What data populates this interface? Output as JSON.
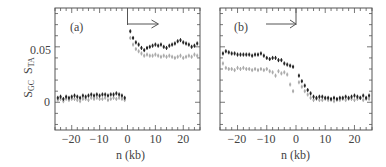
{
  "chart_data": [
    {
      "type": "scatter",
      "panel_label": "(a)",
      "title": "",
      "xlabel": "n (kb)",
      "ylabel": "S_GC  S_TA",
      "xlim": [
        -26,
        26
      ],
      "ylim": [
        -0.025,
        0.085
      ],
      "xticks": [
        -20,
        -10,
        0,
        10,
        20
      ],
      "yticks": [
        0,
        0.05
      ],
      "ytick_labels": [
        "0",
        "0.05"
      ],
      "grid": false,
      "annotation": "arrow pointing right from n=0",
      "series": [
        {
          "name": "S_GC",
          "color": "#222222",
          "x": [
            -25,
            -24,
            -23,
            -22,
            -21,
            -20,
            -19,
            -18,
            -17,
            -16,
            -15,
            -14,
            -13,
            -12,
            -11,
            -10,
            -9,
            -8,
            -7,
            -6,
            -5,
            -4,
            -3,
            -2,
            -1,
            1,
            2,
            3,
            4,
            5,
            6,
            7,
            8,
            9,
            10,
            11,
            12,
            13,
            14,
            15,
            16,
            17,
            18,
            19,
            20,
            21,
            22,
            23,
            24,
            25
          ],
          "y": [
            0.004,
            0.005,
            0.003,
            0.005,
            0.004,
            0.005,
            0.006,
            0.005,
            0.004,
            0.006,
            0.005,
            0.006,
            0.007,
            0.006,
            0.007,
            0.006,
            0.007,
            0.007,
            0.006,
            0.007,
            0.007,
            0.008,
            0.007,
            0.006,
            0.004,
            0.064,
            0.058,
            0.054,
            0.052,
            0.049,
            0.047,
            0.049,
            0.05,
            0.051,
            0.052,
            0.051,
            0.052,
            0.05,
            0.049,
            0.051,
            0.052,
            0.053,
            0.055,
            0.056,
            0.054,
            0.053,
            0.052,
            0.05,
            0.051,
            0.053
          ]
        },
        {
          "name": "S_TA",
          "color": "#aaaaaa",
          "x": [
            -25,
            -24,
            -23,
            -22,
            -21,
            -20,
            -19,
            -18,
            -17,
            -16,
            -15,
            -14,
            -13,
            -12,
            -11,
            -10,
            -9,
            -8,
            -7,
            -6,
            -5,
            -4,
            -3,
            -2,
            -1,
            1,
            2,
            3,
            4,
            5,
            6,
            7,
            8,
            9,
            10,
            11,
            12,
            13,
            14,
            15,
            16,
            17,
            18,
            19,
            20,
            21,
            22,
            23,
            24,
            25
          ],
          "y": [
            0.002,
            0.003,
            0.001,
            0.003,
            0.002,
            0.003,
            0.003,
            0.002,
            0.001,
            0.003,
            0.003,
            0.002,
            0.004,
            0.003,
            0.004,
            0.003,
            0.003,
            0.004,
            0.002,
            0.003,
            0.004,
            0.003,
            0.004,
            0.003,
            0.002,
            0.058,
            0.052,
            0.048,
            0.046,
            0.044,
            0.042,
            0.043,
            0.042,
            0.042,
            0.043,
            0.042,
            0.041,
            0.042,
            0.041,
            0.042,
            0.041,
            0.04,
            0.041,
            0.042,
            0.04,
            0.041,
            0.042,
            0.041,
            0.043,
            0.042
          ]
        }
      ]
    },
    {
      "type": "scatter",
      "panel_label": "(b)",
      "title": "",
      "xlabel": "n (kb)",
      "ylabel": "",
      "xlim": [
        -26,
        26
      ],
      "ylim": [
        -0.025,
        0.085
      ],
      "xticks": [
        -20,
        -10,
        0,
        10,
        20
      ],
      "yticks": [
        0,
        0.05
      ],
      "grid": false,
      "annotation": "arrow pointing right ending at n=0",
      "series": [
        {
          "name": "S_GC",
          "color": "#222222",
          "x": [
            -25,
            -24,
            -23,
            -22,
            -21,
            -20,
            -19,
            -18,
            -17,
            -16,
            -15,
            -14,
            -13,
            -12,
            -11,
            -10,
            -9,
            -8,
            -7,
            -6,
            -5,
            -4,
            -3,
            -2,
            -1,
            1,
            2,
            3,
            4,
            5,
            6,
            7,
            8,
            9,
            10,
            11,
            12,
            13,
            14,
            15,
            16,
            17,
            18,
            19,
            20,
            21,
            22,
            23,
            24,
            25
          ],
          "y": [
            0.044,
            0.046,
            0.045,
            0.044,
            0.044,
            0.043,
            0.043,
            0.043,
            0.043,
            0.043,
            0.042,
            0.043,
            0.043,
            0.044,
            0.042,
            0.04,
            0.039,
            0.04,
            0.04,
            0.038,
            0.038,
            0.035,
            0.034,
            0.033,
            0.032,
            0.024,
            0.019,
            0.015,
            0.011,
            0.008,
            0.005,
            0.004,
            0.005,
            0.005,
            0.004,
            0.004,
            0.003,
            0.004,
            0.003,
            0.004,
            0.004,
            0.005,
            0.004,
            0.005,
            0.006,
            0.005,
            0.004,
            0.006,
            0.004,
            0.006
          ]
        },
        {
          "name": "S_TA",
          "color": "#aaaaaa",
          "x": [
            -25,
            -24,
            -23,
            -22,
            -21,
            -20,
            -19,
            -18,
            -17,
            -16,
            -15,
            -14,
            -13,
            -12,
            -11,
            -10,
            -9,
            -8,
            -7,
            -6,
            -5,
            -4,
            -3,
            -2,
            -1,
            1,
            2,
            3,
            4,
            5,
            6,
            7,
            8,
            9,
            10,
            11,
            12,
            13,
            14,
            15,
            16,
            17,
            18,
            19,
            20,
            21,
            22,
            23,
            24,
            25
          ],
          "y": [
            0.035,
            0.031,
            0.03,
            0.03,
            0.029,
            0.031,
            0.03,
            0.031,
            0.03,
            0.03,
            0.029,
            0.03,
            0.029,
            0.03,
            0.029,
            0.03,
            0.028,
            0.027,
            0.024,
            0.028,
            0.026,
            0.027,
            0.025,
            0.016,
            0.01,
            0.018,
            0.014,
            0.01,
            0.007,
            0.004,
            0.002,
            0.003,
            0.002,
            0.002,
            0.003,
            0.002,
            0.002,
            0.001,
            0.002,
            0.002,
            0.003,
            0.002,
            0.003,
            0.003,
            0.002,
            0.003,
            0.004,
            0.002,
            0.003,
            0.003
          ]
        }
      ]
    }
  ],
  "labels": {
    "panel_a": "(a)",
    "panel_b": "(b)",
    "xlabel": "n (kb)",
    "ylabel_gc_main": "S",
    "ylabel_gc_sub": "GC",
    "ylabel_ta_main": "S",
    "ylabel_ta_sub": "TA",
    "ytick_0": "0",
    "ytick_005": "0.05",
    "xticks": [
      "−20",
      "−10",
      "0",
      "10",
      "20"
    ]
  }
}
